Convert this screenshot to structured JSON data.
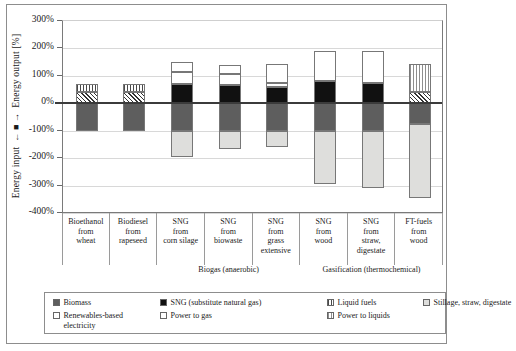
{
  "axis": {
    "y_title_output": "Energy output [%]",
    "y_title_input": "Energy input",
    "yticks": [
      "300%",
      "200%",
      "100%",
      "0%",
      "-100%",
      "-200%",
      "-300%",
      "-400%"
    ]
  },
  "categories": [
    {
      "l1": "Bioethanol",
      "l2": "from",
      "l3": "wheat",
      "l4": ""
    },
    {
      "l1": "Biodiesel",
      "l2": "from",
      "l3": "rapeseed",
      "l4": ""
    },
    {
      "l1": "SNG",
      "l2": "from",
      "l3": "corn silage",
      "l4": ""
    },
    {
      "l1": "SNG",
      "l2": "from",
      "l3": "biowaste",
      "l4": ""
    },
    {
      "l1": "SNG",
      "l2": "from",
      "l3": "grass",
      "l4": "extensive"
    },
    {
      "l1": "SNG",
      "l2": "from",
      "l3": "wood",
      "l4": ""
    },
    {
      "l1": "SNG",
      "l2": "from",
      "l3": "straw,",
      "l4": "digestate"
    },
    {
      "l1": "FT-fuels",
      "l2": "from",
      "l3": "wood",
      "l4": ""
    }
  ],
  "groups": [
    {
      "label": "Biogas (anaerobic)"
    },
    {
      "label": "Gasification (thermochemical)"
    }
  ],
  "legend": [
    {
      "key": "biomass",
      "label": "Biomass"
    },
    {
      "key": "sng",
      "label": "SNG (substitute natural gas)"
    },
    {
      "key": "liquid",
      "label": "Liquid fuels"
    },
    {
      "key": "stillage",
      "label": "Stillage, straw, digestate"
    },
    {
      "key": "renew",
      "label": "Renewables-based electricity"
    },
    {
      "key": "ptg",
      "label": "Power to gas"
    },
    {
      "key": "ptl",
      "label": "Power to liquids"
    }
  ],
  "chart_data": {
    "type": "bar",
    "title": "",
    "xlabel": "",
    "ylabel": "Energy input ← | → Energy output [%]",
    "ylim": [
      -400,
      300
    ],
    "ytick_values": [
      300,
      200,
      100,
      0,
      -100,
      -200,
      -300,
      -400
    ],
    "grid": true,
    "stacked": true,
    "legend_position": "bottom",
    "categories": [
      "Bioethanol from wheat",
      "Biodiesel from rapeseed",
      "SNG from corn silage",
      "SNG from biowaste",
      "SNG from grass extensive",
      "SNG from wood",
      "SNG from straw, digestate",
      "FT-fuels from wood"
    ],
    "series": [
      {
        "name": "Biomass",
        "values": [
          -100,
          -100,
          -100,
          -100,
          -100,
          -100,
          -100,
          -75
        ]
      },
      {
        "name": "Stillage, straw, digestate",
        "values": [
          40,
          40,
          -95,
          -65,
          -60,
          -195,
          -210,
          -270
        ]
      },
      {
        "name": "SNG (substitute natural gas)",
        "values": [
          0,
          0,
          70,
          65,
          60,
          80,
          75,
          0
        ]
      },
      {
        "name": "Liquid fuels",
        "values": [
          30,
          30,
          0,
          0,
          0,
          0,
          0,
          0
        ]
      },
      {
        "name": "Renewables-based electricity",
        "values": [
          0,
          0,
          45,
          40,
          15,
          110,
          115,
          40
        ]
      },
      {
        "name": "Power to gas",
        "values": [
          0,
          0,
          35,
          35,
          70,
          0,
          0,
          0
        ]
      },
      {
        "name": "Power to liquids",
        "values": [
          0,
          0,
          0,
          0,
          0,
          0,
          0,
          105
        ]
      }
    ],
    "bars": [
      {
        "category": "Bioethanol from wheat",
        "segments": [
          {
            "key": "liquid",
            "from": 40,
            "to": 70
          },
          {
            "key": "stillage_hatch",
            "from": 0,
            "to": 40
          },
          {
            "key": "biomass",
            "from": -100,
            "to": 0
          }
        ]
      },
      {
        "category": "Biodiesel from rapeseed",
        "segments": [
          {
            "key": "liquid",
            "from": 40,
            "to": 70
          },
          {
            "key": "stillage_hatch",
            "from": 0,
            "to": 40
          },
          {
            "key": "biomass",
            "from": -100,
            "to": 0
          }
        ]
      },
      {
        "category": "SNG from corn silage",
        "segments": [
          {
            "key": "ptg",
            "from": 115,
            "to": 150
          },
          {
            "key": "renew",
            "from": 70,
            "to": 115
          },
          {
            "key": "sng",
            "from": 0,
            "to": 70
          },
          {
            "key": "biomass",
            "from": -100,
            "to": 0
          },
          {
            "key": "stillage",
            "from": -195,
            "to": -100
          }
        ]
      },
      {
        "category": "SNG from biowaste",
        "segments": [
          {
            "key": "ptg",
            "from": 105,
            "to": 140
          },
          {
            "key": "renew",
            "from": 65,
            "to": 105
          },
          {
            "key": "sng",
            "from": 0,
            "to": 65
          },
          {
            "key": "biomass",
            "from": -100,
            "to": 0
          },
          {
            "key": "stillage",
            "from": -165,
            "to": -100
          }
        ]
      },
      {
        "category": "SNG from grass extensive",
        "segments": [
          {
            "key": "ptg",
            "from": 75,
            "to": 145
          },
          {
            "key": "renew",
            "from": 60,
            "to": 75
          },
          {
            "key": "sng",
            "from": 0,
            "to": 60
          },
          {
            "key": "biomass",
            "from": -100,
            "to": 0
          },
          {
            "key": "stillage",
            "from": -160,
            "to": -100
          }
        ]
      },
      {
        "category": "SNG from wood",
        "segments": [
          {
            "key": "renew",
            "from": 80,
            "to": 190
          },
          {
            "key": "sng",
            "from": 0,
            "to": 80
          },
          {
            "key": "biomass",
            "from": -100,
            "to": 0
          },
          {
            "key": "stillage",
            "from": -295,
            "to": -100
          }
        ]
      },
      {
        "category": "SNG from straw, digestate",
        "segments": [
          {
            "key": "renew",
            "from": 75,
            "to": 190
          },
          {
            "key": "sng",
            "from": 0,
            "to": 75
          },
          {
            "key": "biomass",
            "from": -100,
            "to": 0
          },
          {
            "key": "stillage",
            "from": -310,
            "to": -100
          }
        ]
      },
      {
        "category": "FT-fuels from wood",
        "segments": [
          {
            "key": "ptl",
            "from": 40,
            "to": 145
          },
          {
            "key": "renew_hatch",
            "from": 0,
            "to": 40
          },
          {
            "key": "biomass",
            "from": -75,
            "to": 0
          },
          {
            "key": "stillage",
            "from": -345,
            "to": -75
          }
        ]
      }
    ]
  }
}
